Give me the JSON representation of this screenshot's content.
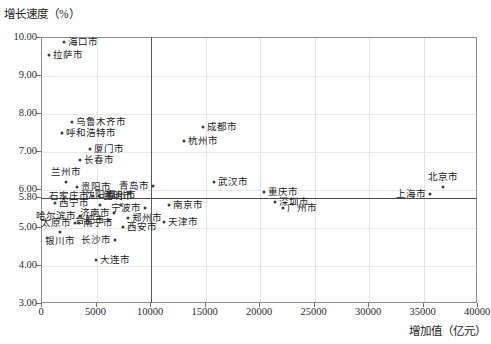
{
  "chart_data": {
    "type": "scatter",
    "title": "",
    "ylabel": "增长速度（%）",
    "xlabel": "增加值（亿元）",
    "xlim": [
      0,
      40000
    ],
    "ylim": [
      3.0,
      10.0
    ],
    "xticks": [
      "0",
      "5000",
      "10000",
      "15000",
      "20000",
      "25000",
      "30000",
      "35000",
      "40000"
    ],
    "yticks": [
      "10.00",
      "9.00",
      "8.00",
      "7.00",
      "6.00",
      "5.80",
      "5.00",
      "4.00",
      "3.00"
    ],
    "grid": true,
    "legend": "none",
    "reference_lines": {
      "vertical_x": 10000,
      "horizontal_y": 5.8
    },
    "marker_color": "#3d3d3d",
    "points": [
      {
        "name": "海口市",
        "x": 2100,
        "y": 9.86,
        "pos": "right"
      },
      {
        "name": "拉萨市",
        "x": 700,
        "y": 9.52,
        "pos": "right"
      },
      {
        "name": "乌鲁木齐市",
        "x": 2800,
        "y": 7.76,
        "pos": "right"
      },
      {
        "name": "呼和浩特市",
        "x": 1900,
        "y": 7.47,
        "pos": "right"
      },
      {
        "name": "成都市",
        "x": 14900,
        "y": 7.63,
        "pos": "right"
      },
      {
        "name": "杭州市",
        "x": 13100,
        "y": 7.26,
        "pos": "right"
      },
      {
        "name": "厦门市",
        "x": 4500,
        "y": 7.05,
        "pos": "right"
      },
      {
        "name": "长春市",
        "x": 3600,
        "y": 6.76,
        "pos": "right"
      },
      {
        "name": "兰州市",
        "x": 2300,
        "y": 6.18,
        "pos": "above"
      },
      {
        "name": "贵阳市",
        "x": 3300,
        "y": 6.05,
        "pos": "right"
      },
      {
        "name": "青岛市",
        "x": 10300,
        "y": 6.07,
        "pos": "left"
      },
      {
        "name": "武汉市",
        "x": 15900,
        "y": 6.18,
        "pos": "right"
      },
      {
        "name": "重庆市",
        "x": 20500,
        "y": 5.92,
        "pos": "right"
      },
      {
        "name": "北京市",
        "x": 36900,
        "y": 6.05,
        "pos": "above"
      },
      {
        "name": "上海市",
        "x": 35700,
        "y": 5.87,
        "pos": "left"
      },
      {
        "name": "石家庄市",
        "x": 4800,
        "y": 5.82,
        "pos": "left"
      },
      {
        "name": "昆明市",
        "x": 5300,
        "y": 5.82,
        "pos": "right"
      },
      {
        "name": "深圳市",
        "x": 21500,
        "y": 5.66,
        "pos": "right"
      },
      {
        "name": "广州市",
        "x": 22200,
        "y": 5.5,
        "pos": "right"
      },
      {
        "name": "西宁市",
        "x": 1300,
        "y": 5.63,
        "pos": "right"
      },
      {
        "name": "沈阳市",
        "x": 5400,
        "y": 5.58,
        "pos": "above"
      },
      {
        "name": "福州市",
        "x": 7300,
        "y": 5.58,
        "pos": "above"
      },
      {
        "name": "宁波市",
        "x": 9500,
        "y": 5.5,
        "pos": "left"
      },
      {
        "name": "南京市",
        "x": 11700,
        "y": 5.58,
        "pos": "right"
      },
      {
        "name": "哈尔滨市",
        "x": 3600,
        "y": 5.29,
        "pos": "left"
      },
      {
        "name": "济南市",
        "x": 6700,
        "y": 5.37,
        "pos": "left"
      },
      {
        "name": "郑州市",
        "x": 8000,
        "y": 5.24,
        "pos": "right"
      },
      {
        "name": "合肥市",
        "x": 6200,
        "y": 5.18,
        "pos": "left"
      },
      {
        "name": "天津市",
        "x": 11300,
        "y": 5.13,
        "pos": "right"
      },
      {
        "name": "太原市",
        "x": 3100,
        "y": 5.11,
        "pos": "left"
      },
      {
        "name": "南宁市",
        "x": 3500,
        "y": 5.11,
        "pos": "right"
      },
      {
        "name": "西安市",
        "x": 7500,
        "y": 5.0,
        "pos": "right"
      },
      {
        "name": "银川市",
        "x": 1700,
        "y": 4.87,
        "pos": "below"
      },
      {
        "name": "长沙市",
        "x": 6800,
        "y": 4.66,
        "pos": "left"
      },
      {
        "name": "大连市",
        "x": 5000,
        "y": 4.13,
        "pos": "right"
      }
    ]
  }
}
